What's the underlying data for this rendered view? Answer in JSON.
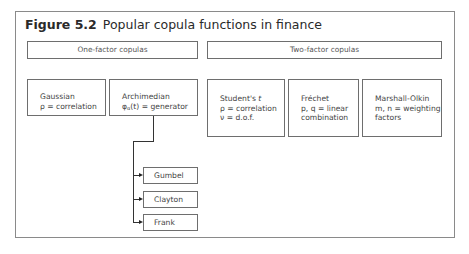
{
  "figure": {
    "label": "Figure 5.2",
    "title": "Popular copula functions in finance"
  },
  "groups": [
    {
      "label": "One-factor copulas"
    },
    {
      "label": "Two-factor copulas"
    }
  ],
  "one_factor": {
    "gaussian": {
      "name": "Gaussian",
      "param": "ρ = correlation"
    },
    "archimedian": {
      "name": "Archimedian",
      "param_symbol": "φ",
      "param_sub": "α",
      "param_rest": "(t) = generator"
    },
    "children": [
      {
        "name": "Gumbel"
      },
      {
        "name": "Clayton"
      },
      {
        "name": "Frank"
      }
    ]
  },
  "two_factor": {
    "student_t": {
      "name": "Student's ",
      "name_italic": "t",
      "line1": "ρ = correlation",
      "line2": "ν = d.o.f."
    },
    "frechet": {
      "name": "Fréchet",
      "line1": "p, q = linear",
      "line2": "combination"
    },
    "marshall_olkin": {
      "name": "Marshall-Olkin",
      "line1": "m, n = weighting",
      "line2": "factors"
    }
  }
}
